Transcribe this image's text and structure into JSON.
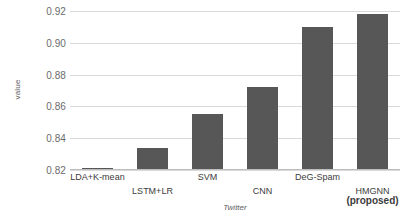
{
  "chart_data": {
    "type": "bar",
    "title": "",
    "xlabel": "Twitter",
    "ylabel": "value",
    "categories": [
      "LDA+K-mean",
      "LSTM+LR",
      "SVM",
      "CNN",
      "DeG-Spam",
      "HMGNN"
    ],
    "category_sublabels": [
      "",
      "",
      "",
      "",
      "",
      "(proposed)"
    ],
    "values": [
      0.8205,
      0.834,
      0.855,
      0.872,
      0.91,
      0.918
    ],
    "ylim": [
      0.82,
      0.92
    ],
    "y_ticks": [
      "0.82",
      "0.84",
      "0.86",
      "0.88",
      "0.90",
      "0.92"
    ],
    "y_tick_values": [
      0.82,
      0.84,
      0.86,
      0.88,
      0.9,
      0.92
    ],
    "grid": true,
    "legend": "none",
    "bar_color": "#575757",
    "grid_color": "#d9d9d9",
    "axis_color": "#bdbdbd",
    "tick_text_color": "#6b6b6b"
  }
}
